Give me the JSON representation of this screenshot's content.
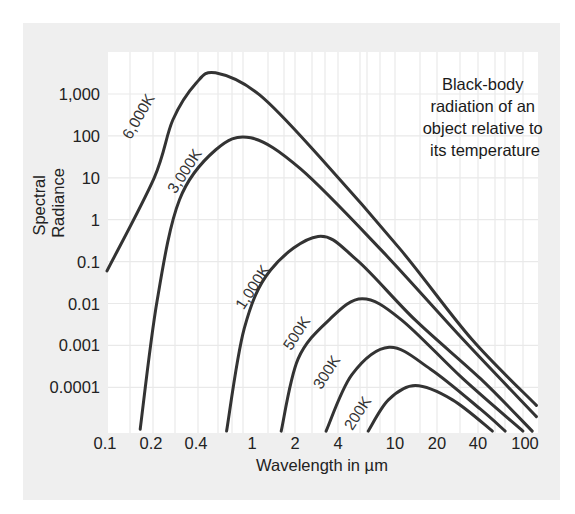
{
  "colors": {
    "panel_bg": "#efefef",
    "plot_bg": "#ffffff",
    "grid": "#e9e9e9",
    "curve": "#333333",
    "text": "#222222"
  },
  "chart_data": {
    "type": "line",
    "title": "Black-body radiation of an object relative to its temperature",
    "annotation_lines": [
      "Black-body",
      "radiation of an",
      "object relative to",
      "its temperature"
    ],
    "xlabel": "Wavelength in µm",
    "ylabel_lines": [
      "Spectral",
      "Radiance"
    ],
    "x_scale": "log",
    "y_scale": "log",
    "xlim": [
      0.1,
      120
    ],
    "ylim": [
      1e-05,
      3000
    ],
    "grid": true,
    "legend": "inline curve labels",
    "x_ticks": [
      {
        "value": 0.1,
        "label": "0.1"
      },
      {
        "value": 0.2,
        "label": "0.2"
      },
      {
        "value": 0.4,
        "label": "0.4"
      },
      {
        "value": 1,
        "label": "1"
      },
      {
        "value": 2,
        "label": "2"
      },
      {
        "value": 4,
        "label": "4"
      },
      {
        "value": 10,
        "label": "10"
      },
      {
        "value": 20,
        "label": "20"
      },
      {
        "value": 40,
        "label": "40"
      },
      {
        "value": 100,
        "label": "100"
      }
    ],
    "y_ticks": [
      {
        "value": 1000,
        "label": "1,000"
      },
      {
        "value": 100,
        "label": "100"
      },
      {
        "value": 10,
        "label": "10"
      },
      {
        "value": 1,
        "label": "1"
      },
      {
        "value": 0.1,
        "label": "0.1"
      },
      {
        "value": 0.01,
        "label": "0.01"
      },
      {
        "value": 0.001,
        "label": "0.001"
      },
      {
        "value": 0.0001,
        "label": "0.0001"
      }
    ],
    "series": [
      {
        "name": "6,000K",
        "label_pos": {
          "x": 143,
          "y": 114,
          "angle": -60
        },
        "points": [
          [
            0.103,
            0.06
          ],
          [
            0.21,
            10
          ],
          [
            0.28,
            240
          ],
          [
            0.4,
            1800
          ],
          [
            0.55,
            3200
          ],
          [
            1.13,
            950
          ],
          [
            3.1,
            27
          ],
          [
            11,
            0.19
          ],
          [
            36,
            0.0014
          ],
          [
            125,
            3.7e-05
          ]
        ]
      },
      {
        "name": "3,000K",
        "label_pos": {
          "x": 189,
          "y": 169,
          "angle": -57
        },
        "points": [
          [
            0.17,
            1e-05
          ],
          [
            0.22,
            0.012
          ],
          [
            0.31,
            3
          ],
          [
            0.55,
            46
          ],
          [
            0.98,
            90
          ],
          [
            2.2,
            16
          ],
          [
            8,
            0.19
          ],
          [
            31,
            0.0014
          ],
          [
            125,
            2e-05
          ]
        ]
      },
      {
        "name": "1,000K",
        "label_pos": {
          "x": 257,
          "y": 285,
          "angle": -57
        },
        "points": [
          [
            0.66,
            9e-06
          ],
          [
            0.88,
            0.0025
          ],
          [
            1.35,
            0.063
          ],
          [
            2.9,
            0.4
          ],
          [
            5.4,
            0.11
          ],
          [
            14,
            0.004
          ],
          [
            42,
            0.00016
          ],
          [
            115,
            9e-06
          ]
        ]
      },
      {
        "name": "500K",
        "label_pos": {
          "x": 301,
          "y": 331,
          "angle": -57
        },
        "points": [
          [
            1.6,
            9e-06
          ],
          [
            2.1,
            0.00047
          ],
          [
            3.5,
            0.0042
          ],
          [
            5.9,
            0.013
          ],
          [
            11,
            0.0042
          ],
          [
            31,
            0.00016
          ],
          [
            96,
            9e-06
          ]
        ]
      },
      {
        "name": "300K",
        "label_pos": {
          "x": 331,
          "y": 370,
          "angle": -57
        },
        "points": [
          [
            3.3,
            9e-06
          ],
          [
            5.0,
            0.0002
          ],
          [
            9.1,
            0.0009
          ],
          [
            18,
            0.00027
          ],
          [
            42,
            3e-05
          ],
          [
            68,
            9e-06
          ]
        ]
      },
      {
        "name": "200K",
        "label_pos": {
          "x": 362,
          "y": 411,
          "angle": -57
        },
        "points": [
          [
            6.5,
            9e-06
          ],
          [
            9,
            5e-05
          ],
          [
            14,
            0.00011
          ],
          [
            26,
            5e-05
          ],
          [
            53,
            9e-06
          ]
        ]
      }
    ]
  }
}
